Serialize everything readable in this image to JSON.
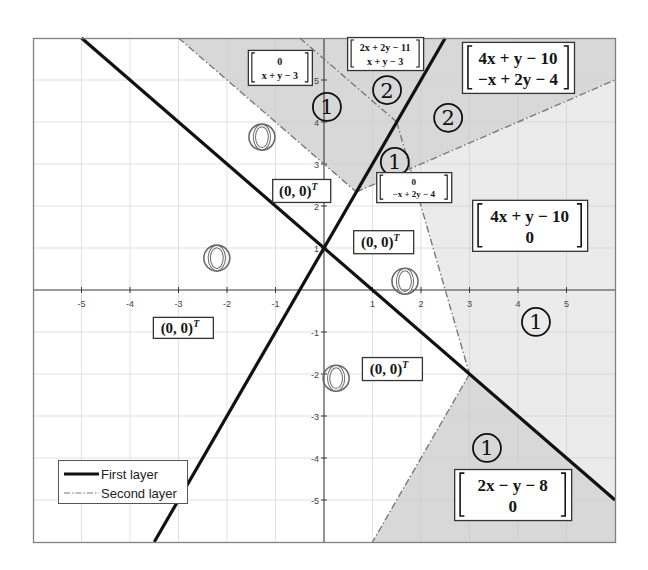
{
  "figure": {
    "xlim": [
      -6,
      6
    ],
    "ylim": [
      -6,
      6
    ],
    "x_ticks": [
      -5,
      -4,
      -3,
      -2,
      -1,
      1,
      2,
      3,
      4,
      5
    ],
    "y_ticks": [
      -5,
      -4,
      -3,
      -2,
      -1,
      1,
      2,
      3,
      4,
      5
    ],
    "grid": true
  },
  "colors": {
    "first_layer": "#111111",
    "second_layer": "#7a7a7a",
    "shade_dark": "#d8d8d8",
    "shade_light": "#ebebeb",
    "frame": "#808080",
    "grid": "#c9c9c9",
    "axis": "#3a3a3a",
    "inactive_count": "#6a6a6a"
  },
  "legend": {
    "first_layer_label": "First layer",
    "second_layer_label": "Second layer"
  },
  "first_layer_lines": [
    {
      "equation": "x + y - 1 = 0",
      "from": [
        -5,
        6
      ],
      "to": [
        6,
        -5
      ]
    },
    {
      "equation": "2x - y + 1 = 0",
      "from": [
        -3.5,
        -6
      ],
      "to": [
        2.5,
        6
      ]
    }
  ],
  "second_layer_lines": [
    {
      "equation": "x + y - 3 = 0",
      "from": [
        -3,
        6
      ],
      "to": [
        0.6667,
        2.3333
      ]
    },
    {
      "equation": "-x + 2y - 4 = 0",
      "from": [
        0.6667,
        2.3333
      ],
      "to": [
        6,
        5
      ]
    },
    {
      "equation": "2x + 2y - 11 = 0",
      "from": [
        -0.5,
        6
      ],
      "to": [
        1.5,
        4
      ]
    },
    {
      "equation": "4x + y - 10 = 0",
      "from": [
        1.5,
        4
      ],
      "to": [
        3,
        -2
      ]
    },
    {
      "equation": "2x - y - 8 = 0",
      "from": [
        3,
        -2
      ],
      "to": [
        1,
        -6
      ]
    }
  ],
  "regions": [
    {
      "name": "region-0-xy3",
      "shade": "shade_dark",
      "polygon": [
        [
          -3,
          6
        ],
        [
          -0.5,
          6
        ],
        [
          1.5,
          4
        ],
        [
          0.6667,
          2.3333
        ]
      ]
    },
    {
      "name": "region-2xy11-xy3",
      "shade": "shade_dark",
      "polygon": [
        [
          -0.5,
          6
        ],
        [
          2.5,
          6
        ],
        [
          1.5,
          4
        ]
      ]
    },
    {
      "name": "region-4xy10-x2y4",
      "shade": "shade_dark",
      "polygon": [
        [
          2.5,
          6
        ],
        [
          6,
          6
        ],
        [
          6,
          5
        ],
        [
          1.7778,
          2.8889
        ],
        [
          1.5,
          4
        ]
      ]
    },
    {
      "name": "region-0-x2y4",
      "shade": "shade_dark",
      "polygon": [
        [
          0.6667,
          2.3333
        ],
        [
          1.5,
          4
        ],
        [
          1.7778,
          2.8889
        ]
      ]
    },
    {
      "name": "region-4xy10-0",
      "shade": "shade_light",
      "polygon": [
        [
          1.7778,
          2.8889
        ],
        [
          6,
          5
        ],
        [
          6,
          -5
        ],
        [
          3,
          -2
        ]
      ]
    },
    {
      "name": "region-2xy8-0",
      "shade": "shade_dark",
      "polygon": [
        [
          3,
          -2
        ],
        [
          6,
          -5
        ],
        [
          6,
          -6
        ],
        [
          1,
          -6
        ]
      ]
    }
  ],
  "activation_counts": [
    {
      "value": "1",
      "center": [
        0.06,
        4.36
      ]
    },
    {
      "value": "2",
      "center": [
        1.3,
        4.76
      ]
    },
    {
      "value": "2",
      "center": [
        2.56,
        4.1
      ]
    },
    {
      "value": "1",
      "center": [
        1.46,
        3.05
      ]
    },
    {
      "value": "0",
      "center": [
        -1.28,
        3.64
      ]
    },
    {
      "value": "0",
      "center": [
        -2.21,
        0.76
      ]
    },
    {
      "value": "0",
      "center": [
        1.67,
        0.21
      ]
    },
    {
      "value": "0",
      "center": [
        0.25,
        -2.1
      ]
    },
    {
      "value": "1",
      "center": [
        4.37,
        -0.76
      ]
    },
    {
      "value": "1",
      "center": [
        3.36,
        -3.76
      ]
    }
  ],
  "output_labels": [
    {
      "kind": "matrix",
      "rows": [
        "0",
        "x + y − 3"
      ],
      "center": [
        -0.91,
        5.3
      ],
      "size": [
        64,
        35
      ],
      "font": 10
    },
    {
      "kind": "matrix",
      "rows": [
        "2x + 2y − 11",
        "x + y − 3"
      ],
      "center": [
        1.26,
        5.63
      ],
      "size": [
        76,
        33
      ],
      "font": 10
    },
    {
      "kind": "matrix",
      "rows": [
        "4x + y − 10",
        "−x + 2y − 4"
      ],
      "center": [
        4.0,
        5.3
      ],
      "size": [
        112,
        51
      ],
      "font": 17
    },
    {
      "kind": "matrix",
      "rows": [
        "0",
        "−x + 2y − 4"
      ],
      "center": [
        1.85,
        2.45
      ],
      "size": [
        75,
        30
      ],
      "font": 9
    },
    {
      "kind": "matrix",
      "rows": [
        "4x + y − 10",
        "0"
      ],
      "center": [
        4.24,
        1.54
      ],
      "size": [
        115,
        51
      ],
      "font": 17
    },
    {
      "kind": "vector",
      "text": "(0, 0)",
      "sup": "T",
      "center": [
        1.22,
        1.15
      ],
      "size": [
        60,
        23
      ],
      "font": 15
    },
    {
      "kind": "vector",
      "text": "(0, 0)",
      "sup": "T",
      "center": [
        -0.47,
        2.37
      ],
      "size": [
        58,
        23
      ],
      "font": 15
    },
    {
      "kind": "vector",
      "text": "(0, 0)",
      "sup": "T",
      "center": [
        -2.91,
        -0.89
      ],
      "size": [
        60,
        21
      ],
      "font": 15
    },
    {
      "kind": "vector",
      "text": "(0, 0)",
      "sup": "T",
      "center": [
        1.4,
        -1.87
      ],
      "size": [
        60,
        23
      ],
      "font": 15
    },
    {
      "kind": "matrix",
      "rows": [
        "2x − y − 8",
        "0"
      ],
      "center": [
        3.89,
        -4.87
      ],
      "size": [
        117,
        51
      ],
      "font": 17
    }
  ]
}
